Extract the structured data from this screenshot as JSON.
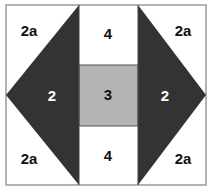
{
  "diagram": {
    "colors": {
      "dark": "#333333",
      "medium": "#b4b4b4",
      "light": "#ffffff",
      "border": "#9a9a9a"
    },
    "labels": {
      "top_left": "2a",
      "top_right": "2a",
      "bottom_left": "2a",
      "bottom_right": "2a",
      "left_triangle": "2",
      "right_triangle": "2",
      "center": "3",
      "top_center": "4",
      "bottom_center": "4"
    }
  }
}
